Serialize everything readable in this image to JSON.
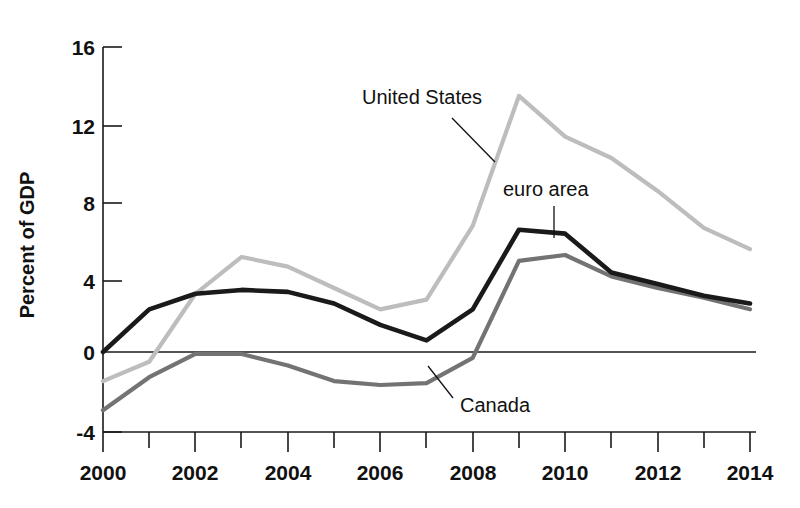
{
  "chart_data": {
    "type": "line",
    "title": "",
    "subtitle": "",
    "xlabel": "",
    "ylabel": "Percent of GDP",
    "xlim": [
      2000,
      2014
    ],
    "ylim": [
      -4,
      16
    ],
    "grid": false,
    "legend_position": "inline-annotations",
    "x": [
      2000,
      2001,
      2002,
      2003,
      2004,
      2005,
      2006,
      2007,
      2008,
      2009,
      2010,
      2011,
      2012,
      2013,
      2014
    ],
    "x_tick_labels": [
      "2000",
      "2002",
      "2004",
      "2006",
      "2008",
      "2010",
      "2012",
      "2014"
    ],
    "x_tick_values": [
      2000,
      2002,
      2004,
      2006,
      2008,
      2010,
      2012,
      2014
    ],
    "x_minor_ticks": [
      2001,
      2003,
      2005,
      2007,
      2009,
      2011,
      2013
    ],
    "y_tick_labels": [
      "16",
      "12",
      "8",
      "4",
      "0",
      "-4"
    ],
    "y_tick_values": [
      16,
      12,
      8,
      4,
      0,
      -4
    ],
    "zero_line": 0,
    "series": [
      {
        "name": "United States",
        "color": "#bdbdbd",
        "values": [
          -1.5,
          -0.5,
          3.0,
          4.9,
          4.4,
          3.3,
          2.2,
          2.7,
          6.5,
          13.2,
          11.1,
          10.0,
          8.3,
          6.4,
          5.3
        ]
      },
      {
        "name": "euro area",
        "color": "#1a1a1a",
        "values": [
          0.0,
          2.2,
          3.0,
          3.2,
          3.1,
          2.5,
          1.4,
          0.6,
          2.2,
          6.3,
          6.1,
          4.1,
          3.5,
          2.9,
          2.5
        ]
      },
      {
        "name": "Canada",
        "color": "#737373",
        "values": [
          -3.0,
          -1.3,
          -0.1,
          -0.1,
          -0.7,
          -1.5,
          -1.7,
          -1.6,
          -0.3,
          4.7,
          5.0,
          3.9,
          3.3,
          2.8,
          2.2
        ]
      }
    ],
    "annotations": [
      {
        "text": "United States",
        "series": "United States"
      },
      {
        "text": "euro area",
        "series": "euro area"
      },
      {
        "text": "Canada",
        "series": "Canada"
      }
    ]
  },
  "axis": {
    "y_title": "Percent of GDP"
  },
  "labels": {
    "united_states": "United States",
    "euro_area": "euro area",
    "canada": "Canada"
  },
  "y_ticks": {
    "t0": "16",
    "t1": "12",
    "t2": "8",
    "t3": "4",
    "t4": "0",
    "t5": "-4"
  },
  "x_ticks": {
    "t0": "2000",
    "t1": "2002",
    "t2": "2004",
    "t3": "2006",
    "t4": "2008",
    "t5": "2010",
    "t6": "2012",
    "t7": "2014"
  }
}
